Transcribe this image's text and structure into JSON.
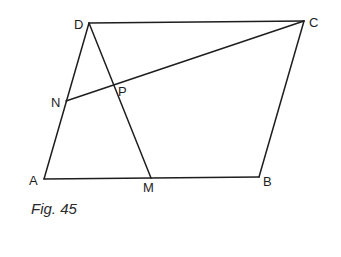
{
  "figure": {
    "caption": "Fig. 45",
    "stroke_color": "#1e1e1e",
    "points": {
      "A": {
        "label": "A",
        "x": 44,
        "y": 179
      },
      "B": {
        "label": "B",
        "x": 259,
        "y": 177
      },
      "C": {
        "label": "C",
        "x": 304,
        "y": 21
      },
      "D": {
        "label": "D",
        "x": 89,
        "y": 23
      },
      "M": {
        "label": "M",
        "x": 151,
        "y": 178
      },
      "N": {
        "label": "N",
        "x": 66,
        "y": 101
      },
      "P": {
        "label": "P",
        "x": 114,
        "y": 86
      }
    },
    "segments": [
      {
        "from": "A",
        "to": "B"
      },
      {
        "from": "B",
        "to": "C"
      },
      {
        "from": "C",
        "to": "D"
      },
      {
        "from": "D",
        "to": "A"
      },
      {
        "from": "D",
        "to": "M"
      },
      {
        "from": "N",
        "to": "C"
      }
    ]
  }
}
